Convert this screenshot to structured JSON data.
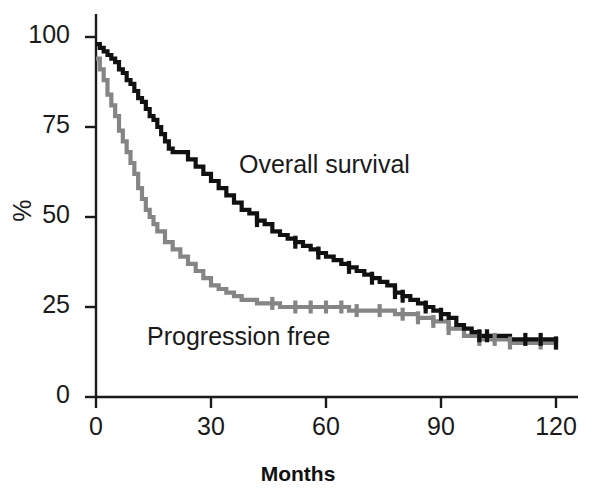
{
  "chart_data": {
    "type": "line",
    "chart_kind": "kaplan-meier-survival",
    "title": "",
    "xlabel": "Months",
    "ylabel": "%",
    "xlim": [
      0,
      120
    ],
    "ylim": [
      0,
      100
    ],
    "xticks": [
      0,
      30,
      60,
      90,
      120
    ],
    "xtick_labels": [
      "0",
      "30",
      "60",
      "90",
      "120"
    ],
    "yticks": [
      0,
      25,
      50,
      75,
      100
    ],
    "ytick_labels": [
      "0",
      "25",
      "50",
      "75",
      "100"
    ],
    "grid": false,
    "legend_position": "inline-annotations",
    "series": [
      {
        "name": "Overall survival",
        "color": "#111111",
        "label_text": "Overall survival",
        "x": [
          0,
          1,
          2,
          3,
          4,
          5,
          6,
          7,
          8,
          9,
          10,
          11,
          12,
          13,
          14,
          15,
          16,
          17,
          18,
          19,
          20,
          22,
          24,
          26,
          28,
          30,
          32,
          34,
          36,
          38,
          40,
          42,
          44,
          46,
          48,
          50,
          52,
          54,
          56,
          58,
          60,
          62,
          64,
          66,
          68,
          70,
          72,
          74,
          76,
          78,
          80,
          82,
          84,
          86,
          88,
          90,
          92,
          94,
          96,
          98,
          100,
          104,
          108,
          112,
          116,
          120
        ],
        "y": [
          98,
          97,
          96,
          95,
          94,
          93,
          91,
          90,
          88,
          87,
          85,
          83,
          82,
          80,
          78,
          77,
          75,
          73,
          71,
          69,
          68,
          68,
          66,
          64,
          62,
          60,
          58,
          56,
          54,
          52,
          51,
          49,
          48,
          46,
          45,
          44,
          43,
          42,
          41,
          40,
          39,
          38,
          37,
          36,
          35,
          34,
          33,
          32,
          31,
          29,
          28,
          27,
          26,
          25,
          24,
          23,
          22,
          20,
          19,
          18,
          17,
          17,
          16,
          16,
          16,
          15
        ]
      },
      {
        "name": "Progression free",
        "color": "#858585",
        "label_text": "Progression free",
        "x": [
          0,
          1,
          2,
          3,
          4,
          5,
          6,
          7,
          8,
          9,
          10,
          11,
          12,
          13,
          14,
          15,
          16,
          18,
          20,
          22,
          24,
          26,
          28,
          30,
          32,
          34,
          36,
          38,
          40,
          42,
          44,
          46,
          48,
          50,
          54,
          58,
          62,
          66,
          70,
          74,
          78,
          80,
          84,
          88,
          92,
          96,
          100,
          104,
          108,
          112,
          116,
          120
        ],
        "y": [
          94,
          91,
          88,
          84,
          81,
          78,
          74,
          71,
          68,
          65,
          62,
          58,
          55,
          52,
          50,
          48,
          46,
          43,
          41,
          39,
          37,
          35,
          33,
          31,
          30,
          29,
          28,
          27,
          27,
          26,
          26,
          26,
          25,
          25,
          25,
          25,
          25,
          24,
          24,
          24,
          23,
          23,
          22,
          21,
          19,
          17,
          16,
          16,
          15,
          15,
          15,
          15
        ]
      }
    ],
    "censor_marks": {
      "Overall survival": [
        42,
        52,
        58,
        66,
        72,
        78,
        80,
        86,
        90,
        100,
        102,
        112,
        116,
        120
      ],
      "Progression free": [
        46,
        52,
        56,
        60,
        64,
        68,
        74,
        80,
        84,
        88,
        92,
        100,
        104,
        108,
        116,
        120
      ]
    }
  },
  "annotations": {
    "overall_survival_label": "Overall survival",
    "progression_free_label": "Progression free"
  },
  "colors": {
    "overall_survival": "#111111",
    "progression_free": "#858585",
    "axis": "#1a1a1a",
    "background": "#ffffff"
  }
}
